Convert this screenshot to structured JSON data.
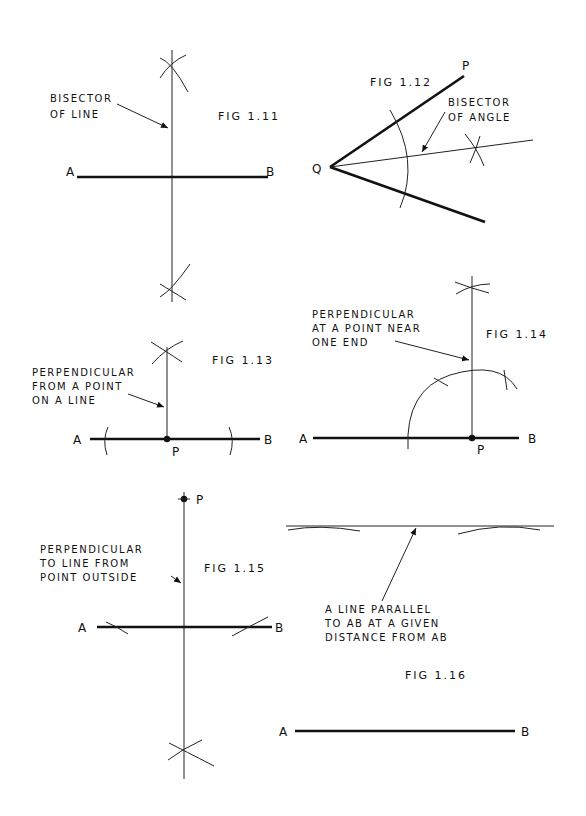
{
  "figures": {
    "fig_1_11": {
      "caption": "FIG 1.11",
      "note_line1": "BISECTOR",
      "note_line2": "OF LINE",
      "point_a": "A",
      "point_b": "B"
    },
    "fig_1_12": {
      "caption": "FIG 1.12",
      "note_line1": "BISECTOR",
      "note_line2": "OF ANGLE",
      "point_p": "P",
      "point_q": "Q"
    },
    "fig_1_13": {
      "caption": "FIG 1.13",
      "note_line1": "PERPENDICULAR",
      "note_line2": "FROM A POINT",
      "note_line3": "ON A LINE",
      "point_a": "A",
      "point_b": "B",
      "point_p": "P"
    },
    "fig_1_14": {
      "caption": "FIG 1.14",
      "note_line1": "PERPENDICULAR",
      "note_line2": "AT A POINT NEAR",
      "note_line3": "ONE END",
      "point_a": "A",
      "point_b": "B",
      "point_p": "P"
    },
    "fig_1_15": {
      "caption": "FIG 1.15",
      "note_line1": "PERPENDICULAR",
      "note_line2": "TO LINE FROM",
      "note_line3": "POINT OUTSIDE",
      "point_a": "A",
      "point_b": "B",
      "point_p": "P"
    },
    "fig_1_16": {
      "caption": "FIG 1.16",
      "note_line1": "A LINE PARALLEL",
      "note_line2": "TO AB AT A GIVEN",
      "note_line3": "DISTANCE FROM AB",
      "point_a": "A",
      "point_b": "B"
    }
  }
}
